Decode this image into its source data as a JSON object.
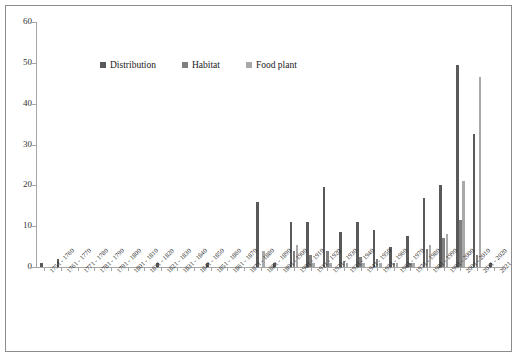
{
  "chart_data": {
    "type": "bar",
    "title": "",
    "xlabel": "",
    "ylabel": "",
    "ylim": [
      0,
      60
    ],
    "ytick_step": 10,
    "ytick_labels": [
      "0",
      "10",
      "20",
      "30",
      "40",
      "50",
      "60"
    ],
    "grid": false,
    "legend_position": "top-center",
    "categories": [
      "1751 - 1760",
      "1761 - 1770",
      "1771 - 1780",
      "1781 - 1790",
      "1791 - 1800",
      "1801 - 1810",
      "1811 - 1820",
      "1821 - 1830",
      "1831 - 1840",
      "1841 - 1850",
      "1851 - 1860",
      "1861 - 1870",
      "1871 - 1880",
      "1881 - 1890",
      "1891 - 1900",
      "1901 - 1910",
      "1911 - 1920",
      "1921 - 1930",
      "1931 - 1940",
      "1941 - 1950",
      "1951 - 1960",
      "1961 - 1970",
      "1971 - 1980",
      "1981 - 1990",
      "1991 - 2000",
      "2001 - 2010",
      "2011 - 2020",
      "2021"
    ],
    "series": [
      {
        "name": "Distribution",
        "color": "#595959",
        "values": [
          1,
          2,
          0,
          0,
          0,
          0,
          0,
          1,
          0,
          0,
          1,
          0,
          0,
          16,
          1,
          11,
          11,
          19.5,
          8.5,
          11,
          9,
          5,
          7.5,
          17,
          20,
          49.5,
          32.5,
          1
        ]
      },
      {
        "name": "Habitat",
        "color": "#808080",
        "values": [
          0,
          0,
          0,
          0,
          0,
          0,
          0,
          0,
          0,
          0,
          0,
          0,
          0,
          0,
          0,
          4,
          3,
          4,
          1.5,
          2.5,
          2,
          1,
          1,
          4.5,
          7,
          11.5,
          3,
          0
        ]
      },
      {
        "name": "Food plant",
        "color": "#a9a9a9",
        "values": [
          0,
          0,
          0,
          0,
          0,
          0,
          0,
          0,
          0,
          0,
          0,
          0,
          0,
          4,
          0,
          5.5,
          1,
          1,
          1,
          1,
          1,
          1,
          1,
          5.5,
          8,
          21,
          46.5,
          0
        ]
      }
    ]
  },
  "legend": {
    "items": [
      {
        "label": "Distribution",
        "color": "#595959"
      },
      {
        "label": "Habitat",
        "color": "#808080"
      },
      {
        "label": "Food plant",
        "color": "#a9a9a9"
      }
    ]
  }
}
